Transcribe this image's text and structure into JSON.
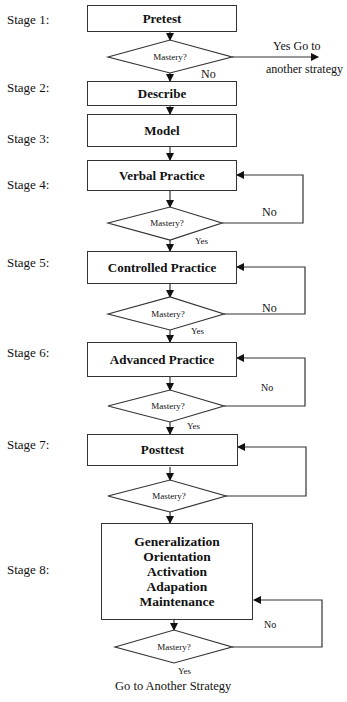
{
  "diagram": {
    "type": "flowchart",
    "stages": [
      {
        "label": "Stage 1:",
        "box": [
          "Pretest"
        ],
        "decision": "Mastery?",
        "yes": "Yes   Go to",
        "yes2": "another strategy",
        "no": "No"
      },
      {
        "label": "Stage 2:",
        "box": [
          "Describe"
        ]
      },
      {
        "label": "Stage 3:",
        "box": [
          "Model"
        ]
      },
      {
        "label": "Stage 4:",
        "box": [
          "Verbal Practice"
        ],
        "decision": "Mastery?",
        "yes": "Yes",
        "no": "No"
      },
      {
        "label": "Stage 5:",
        "box": [
          "Controlled Practice"
        ],
        "decision": "Mastery?",
        "yes": "Yes",
        "no": "No"
      },
      {
        "label": "Stage 6:",
        "box": [
          "Advanced Practice"
        ],
        "decision": "Mastery?",
        "yes": "Yes",
        "no": "No"
      },
      {
        "label": "Stage 7:",
        "box": [
          "Posttest"
        ],
        "decision": "Mastery?"
      },
      {
        "label": "Stage 8:",
        "box": [
          "Generalization",
          "Orientation",
          "Activation",
          "Adapation",
          "Maintenance"
        ],
        "decision": "Mastery?",
        "yes": "Yes",
        "no": "No"
      }
    ],
    "end_label": "Go to Another Strategy"
  }
}
